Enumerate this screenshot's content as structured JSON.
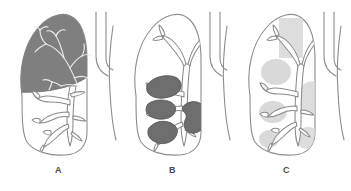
{
  "figure": {
    "background_color": "#ffffff",
    "panel_count": 3,
    "outline_color": "#8d8d8d",
    "label_color": "#4a4a4a"
  },
  "panels": [
    {
      "id": "panel-a",
      "label": "A",
      "shading_name": "upper-lobe-solid-fill",
      "shading_color": "#7f7f7f",
      "shading_description": "Entire upper lobe filled solid dark gray with bronchial tree shown in white outline"
    },
    {
      "id": "panel-b",
      "label": "B",
      "shading_name": "multiple-dark-masses",
      "shading_color": "#6e6e6e",
      "shading_description": "Several discrete dark gray irregular masses clustered along the bronchi, plus one larger kidney-shaped mass near the hilum"
    },
    {
      "id": "panel-c",
      "label": "C",
      "shading_name": "faint-patchy-opacities",
      "shading_color": "#d7d7d7",
      "shading_description": "Diffuse faint light gray patchy opacities scattered through the lung including an apical rectangular band"
    }
  ]
}
